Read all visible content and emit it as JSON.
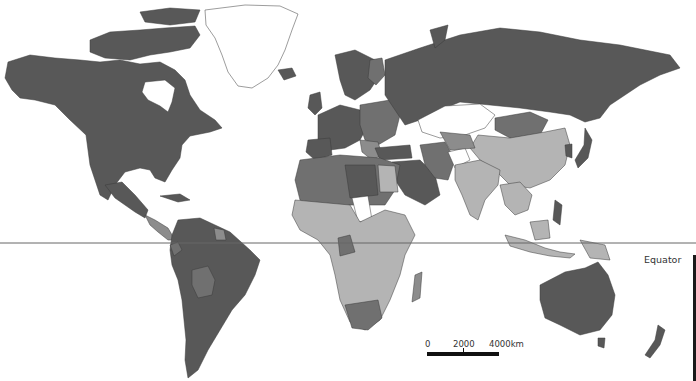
{
  "map": {
    "type": "world choropleth (grayscale)",
    "projection": "equirectangular-like world map",
    "legend_shades": {
      "darkest": "#585858",
      "dark": "#707070",
      "medium": "#8c8c8c",
      "light": "#b4b4b4",
      "no_data": "#ffffff"
    },
    "regions": [
      {
        "name": "North America (Canada, USA, Alaska)",
        "shade": "darkest"
      },
      {
        "name": "Greenland",
        "shade": "no_data"
      },
      {
        "name": "Mexico",
        "shade": "darkest"
      },
      {
        "name": "Central America",
        "shade": "medium"
      },
      {
        "name": "South America",
        "shade": "darkest"
      },
      {
        "name": "Bolivia",
        "shade": "dark"
      },
      {
        "name": "Russia",
        "shade": "darkest"
      },
      {
        "name": "Europe",
        "shade": "darkest"
      },
      {
        "name": "Eastern Europe",
        "shade": "dark"
      },
      {
        "name": "Kazakhstan",
        "shade": "no_data"
      },
      {
        "name": "Mongolia",
        "shade": "dark"
      },
      {
        "name": "China",
        "shade": "light"
      },
      {
        "name": "India",
        "shade": "light"
      },
      {
        "name": "Middle East",
        "shade": "darkest"
      },
      {
        "name": "Iran",
        "shade": "dark"
      },
      {
        "name": "Afghanistan",
        "shade": "no_data"
      },
      {
        "name": "North Africa",
        "shade": "dark"
      },
      {
        "name": "Sub-Saharan Africa",
        "shade": "light"
      },
      {
        "name": "Chad/Niger",
        "shade": "no_data"
      },
      {
        "name": "South Africa",
        "shade": "dark"
      },
      {
        "name": "Southeast Asia",
        "shade": "light"
      },
      {
        "name": "Japan/Korea",
        "shade": "darkest"
      },
      {
        "name": "Australia",
        "shade": "darkest"
      },
      {
        "name": "New Zealand",
        "shade": "darkest"
      }
    ]
  },
  "equator": {
    "label": "Equator"
  },
  "scale_bar": {
    "labels": [
      "0",
      "2000",
      "4000km"
    ]
  }
}
